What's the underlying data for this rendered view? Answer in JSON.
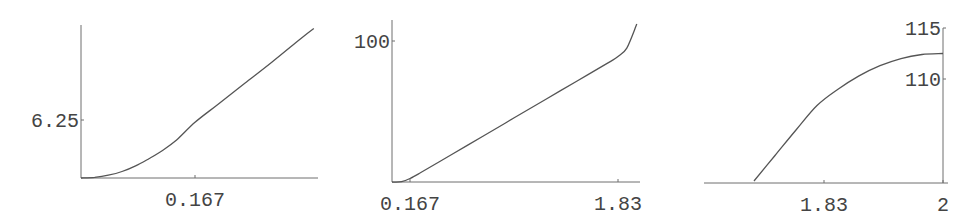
{
  "chart_data": [
    {
      "type": "line",
      "title": "",
      "xlabel": "",
      "ylabel": "",
      "xlim": [
        0,
        0.347
      ],
      "ylim": [
        0,
        16.3
      ],
      "x_ticks": [
        {
          "value": 0.167,
          "label": "0.167"
        }
      ],
      "y_ticks": [
        {
          "value": 6.25,
          "label": "6.25"
        }
      ],
      "grid": false,
      "series": [
        {
          "name": "curve-1",
          "x": [
            0,
            0.02,
            0.04,
            0.06,
            0.08,
            0.1,
            0.12,
            0.14,
            0.167,
            0.2,
            0.24,
            0.28,
            0.32,
            0.341
          ],
          "y": [
            0,
            0.07,
            0.3,
            0.7,
            1.3,
            2.1,
            3.0,
            4.1,
            6.0,
            7.9,
            10.2,
            12.5,
            14.9,
            16.1
          ]
        }
      ]
    },
    {
      "type": "line",
      "title": "",
      "xlabel": "",
      "ylabel": "",
      "xlim": [
        0.023,
        1.99
      ],
      "ylim": [
        0,
        115
      ],
      "x_ticks": [
        {
          "value": 0.167,
          "label": "0.167"
        },
        {
          "value": 1.83,
          "label": "1.83"
        }
      ],
      "y_ticks": [
        {
          "value": 100,
          "label": "100"
        }
      ],
      "grid": false,
      "series": [
        {
          "name": "curve-2",
          "x": [
            0.023,
            0.1,
            0.167,
            0.25,
            0.5,
            0.75,
            1.0,
            1.25,
            1.5,
            1.75,
            1.83,
            1.9,
            1.98
          ],
          "y": [
            0,
            0.2,
            2.5,
            6.5,
            19.5,
            32.5,
            45.5,
            58.5,
            71.5,
            84.5,
            89,
            95,
            112
          ]
        }
      ]
    },
    {
      "type": "line",
      "title": "",
      "xlabel": "",
      "ylabel": "",
      "xlim": [
        1.66,
        2.0
      ],
      "ylim": [
        100,
        115
      ],
      "x_ticks": [
        {
          "value": 1.83,
          "label": "1.83"
        },
        {
          "value": 2,
          "label": "2"
        }
      ],
      "y_ticks": [
        {
          "value": 110,
          "label": "110"
        },
        {
          "value": 115,
          "label": "115"
        }
      ],
      "grid": false,
      "series": [
        {
          "name": "curve-3",
          "x": [
            1.73,
            1.76,
            1.79,
            1.82,
            1.85,
            1.88,
            1.91,
            1.94,
            1.97,
            2.0
          ],
          "y": [
            100,
            102.5,
            105.0,
            107.4,
            109.0,
            110.3,
            111.3,
            112.0,
            112.4,
            112.5
          ]
        }
      ]
    }
  ]
}
